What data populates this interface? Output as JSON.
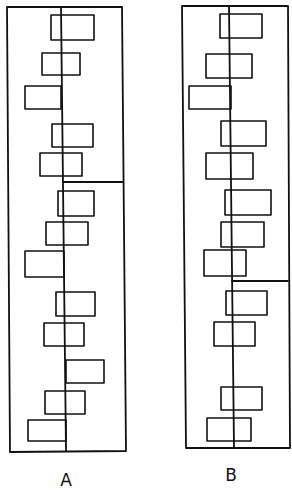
{
  "diagram": {
    "background": "#ffffff",
    "line_color": "#111111",
    "panels": [
      {
        "id": "A",
        "label": "A",
        "label_pos": [
          66,
          486
        ],
        "frame": {
          "top_left": [
            7,
            7
          ],
          "top_right": [
            122,
            7
          ],
          "bottom_right": [
            126,
            451
          ],
          "bottom_left": [
            10,
            452
          ]
        },
        "center_line": {
          "x_top": 61,
          "x_bottom": 66,
          "y_top": 7,
          "y_bottom": 451
        },
        "divider": {
          "y": 182,
          "x_start": 63,
          "x_end": 123
        },
        "boxes": [
          [
            51,
            15,
            94,
            40
          ],
          [
            42,
            53,
            80,
            75
          ],
          [
            25,
            86,
            61,
            109
          ],
          [
            52,
            124,
            93,
            147
          ],
          [
            40,
            153,
            82,
            176
          ],
          [
            58,
            191,
            94,
            216
          ],
          [
            46,
            222,
            88,
            245
          ],
          [
            25,
            251,
            64,
            277
          ],
          [
            56,
            292,
            95,
            316
          ],
          [
            44,
            323,
            84,
            346
          ],
          [
            66,
            360,
            104,
            383
          ],
          [
            45,
            391,
            85,
            414
          ],
          [
            28,
            420,
            66,
            441
          ]
        ]
      },
      {
        "id": "B",
        "label": "B",
        "label_pos": [
          231,
          481
        ],
        "frame": {
          "top_left": [
            182,
            6
          ],
          "top_right": [
            288,
            6
          ],
          "bottom_right": [
            290,
            448
          ],
          "bottom_left": [
            186,
            448
          ]
        },
        "center_line": {
          "x_top": 229,
          "x_bottom": 234,
          "y_top": 6,
          "y_bottom": 448
        },
        "divider": {
          "y": 281,
          "x_start": 232,
          "x_end": 288
        },
        "boxes": [
          [
            220,
            14,
            262,
            38
          ],
          [
            206,
            54,
            252,
            78
          ],
          [
            189,
            86,
            231,
            109
          ],
          [
            221,
            121,
            266,
            146
          ],
          [
            206,
            153,
            253,
            179
          ],
          [
            225,
            190,
            271,
            215
          ],
          [
            221,
            222,
            264,
            247
          ],
          [
            204,
            250,
            246,
            276
          ],
          [
            226,
            291,
            267,
            315
          ],
          [
            214,
            322,
            255,
            346
          ],
          [
            221,
            387,
            262,
            410
          ],
          [
            207,
            418,
            251,
            441
          ]
        ]
      }
    ]
  }
}
